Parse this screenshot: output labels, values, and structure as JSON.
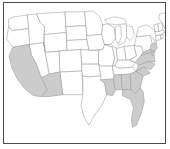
{
  "figure": {
    "kind": "choropleth-map",
    "region": "united-states-lower-48",
    "title": "",
    "caption": "",
    "frame_color": "#4a4a4a",
    "background_color": "#ffffff",
    "border_color": "#9a9a9a",
    "shaded_color": "#cccccc",
    "unshaded_color": "#ffffff"
  },
  "map_data": {
    "type": "choropleth",
    "projection": "albers-usa",
    "shaded_label": "shaded",
    "unshaded_label": "unshaded",
    "legend_visible": false,
    "labels_visible": false,
    "states": [
      {
        "code": "WA",
        "name": "Washington",
        "shaded": false
      },
      {
        "code": "OR",
        "name": "Oregon",
        "shaded": false
      },
      {
        "code": "CA",
        "name": "California",
        "shaded": true
      },
      {
        "code": "NV",
        "name": "Nevada",
        "shaded": false
      },
      {
        "code": "ID",
        "name": "Idaho",
        "shaded": false
      },
      {
        "code": "MT",
        "name": "Montana",
        "shaded": false
      },
      {
        "code": "WY",
        "name": "Wyoming",
        "shaded": false
      },
      {
        "code": "UT",
        "name": "Utah",
        "shaded": false
      },
      {
        "code": "AZ",
        "name": "Arizona",
        "shaded": true
      },
      {
        "code": "CO",
        "name": "Colorado",
        "shaded": false
      },
      {
        "code": "NM",
        "name": "New Mexico",
        "shaded": false
      },
      {
        "code": "ND",
        "name": "North Dakota",
        "shaded": false
      },
      {
        "code": "SD",
        "name": "South Dakota",
        "shaded": false
      },
      {
        "code": "NE",
        "name": "Nebraska",
        "shaded": false
      },
      {
        "code": "KS",
        "name": "Kansas",
        "shaded": false
      },
      {
        "code": "OK",
        "name": "Oklahoma",
        "shaded": false
      },
      {
        "code": "TX",
        "name": "Texas",
        "shaded": false
      },
      {
        "code": "MN",
        "name": "Minnesota",
        "shaded": false
      },
      {
        "code": "IA",
        "name": "Iowa",
        "shaded": false
      },
      {
        "code": "MO",
        "name": "Missouri",
        "shaded": false
      },
      {
        "code": "AR",
        "name": "Arkansas",
        "shaded": false
      },
      {
        "code": "LA",
        "name": "Louisiana",
        "shaded": true
      },
      {
        "code": "WI",
        "name": "Wisconsin",
        "shaded": false
      },
      {
        "code": "IL",
        "name": "Illinois",
        "shaded": false
      },
      {
        "code": "MI",
        "name": "Michigan",
        "shaded": false
      },
      {
        "code": "IN",
        "name": "Indiana",
        "shaded": false
      },
      {
        "code": "OH",
        "name": "Ohio",
        "shaded": false
      },
      {
        "code": "KY",
        "name": "Kentucky",
        "shaded": false
      },
      {
        "code": "TN",
        "name": "Tennessee",
        "shaded": false
      },
      {
        "code": "MS",
        "name": "Mississippi",
        "shaded": true
      },
      {
        "code": "AL",
        "name": "Alabama",
        "shaded": true
      },
      {
        "code": "GA",
        "name": "Georgia",
        "shaded": true
      },
      {
        "code": "FL",
        "name": "Florida",
        "shaded": true
      },
      {
        "code": "SC",
        "name": "South Carolina",
        "shaded": true
      },
      {
        "code": "NC",
        "name": "North Carolina",
        "shaded": true
      },
      {
        "code": "VA",
        "name": "Virginia",
        "shaded": true
      },
      {
        "code": "WV",
        "name": "West Virginia",
        "shaded": false
      },
      {
        "code": "MD",
        "name": "Maryland",
        "shaded": true
      },
      {
        "code": "DE",
        "name": "Delaware",
        "shaded": true
      },
      {
        "code": "PA",
        "name": "Pennsylvania",
        "shaded": false
      },
      {
        "code": "NJ",
        "name": "New Jersey",
        "shaded": true
      },
      {
        "code": "NY",
        "name": "New York",
        "shaded": false
      },
      {
        "code": "CT",
        "name": "Connecticut",
        "shaded": false
      },
      {
        "code": "RI",
        "name": "Rhode Island",
        "shaded": false
      },
      {
        "code": "MA",
        "name": "Massachusetts",
        "shaded": false
      },
      {
        "code": "VT",
        "name": "Vermont",
        "shaded": false
      },
      {
        "code": "NH",
        "name": "New Hampshire",
        "shaded": false
      },
      {
        "code": "ME",
        "name": "Maine",
        "shaded": false
      }
    ],
    "shaded_states": [
      "CA",
      "AZ",
      "LA",
      "MS",
      "AL",
      "GA",
      "FL",
      "SC",
      "NC",
      "VA",
      "MD",
      "DE",
      "NJ"
    ],
    "shaded_count": 13,
    "total_count": 48
  }
}
